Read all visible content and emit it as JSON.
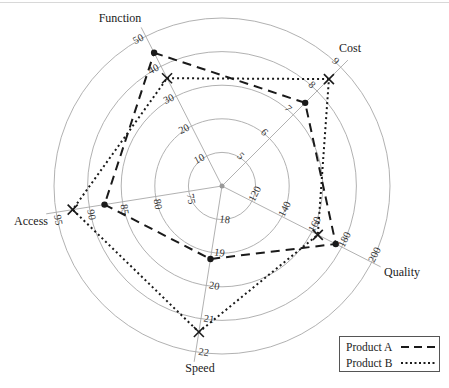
{
  "chart_data": {
    "type": "radar",
    "title": "",
    "axes": [
      {
        "name": "Function",
        "ticks": [
          10,
          20,
          30,
          40,
          50
        ],
        "angle_deg": -117
      },
      {
        "name": "Cost",
        "ticks": [
          5,
          6,
          7,
          8,
          9
        ],
        "angle_deg": -45
      },
      {
        "name": "Quality",
        "ticks": [
          120,
          140,
          160,
          180,
          200
        ],
        "angle_deg": 27
      },
      {
        "name": "Speed",
        "ticks": [
          18,
          19,
          20,
          21,
          22
        ],
        "angle_deg": 99
      },
      {
        "name": "Access",
        "ticks": [
          75,
          80,
          85,
          90,
          95
        ],
        "angle_deg": 171
      }
    ],
    "categories": [
      "Function",
      "Cost",
      "Quality",
      "Speed",
      "Access"
    ],
    "series": [
      {
        "name": "Product A",
        "line_style": "dashed",
        "marker": "dot",
        "values": [
          44.5,
          7.5,
          176,
          19.2,
          87.7
        ]
      },
      {
        "name": "Product B",
        "line_style": "dotted",
        "marker": "x",
        "values": [
          36,
          8.5,
          164,
          21.4,
          92.5
        ]
      }
    ],
    "grid": "concentric circles (5 rings)",
    "legend_position": "bottom-right"
  },
  "legend": {
    "items": [
      {
        "label": "Product A",
        "style": "dashed"
      },
      {
        "label": "Product B",
        "style": "dotted"
      }
    ]
  },
  "colors": {
    "ink": "#1a1a1a",
    "grid": "#a8a8a8"
  }
}
